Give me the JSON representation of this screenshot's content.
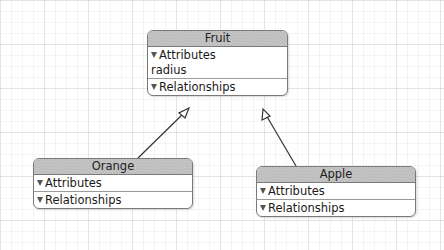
{
  "diagram": {
    "type": "entity-relationship",
    "entities": [
      {
        "name": "Fruit",
        "sections": {
          "attributes_label": "Attributes",
          "attributes": [
            "radius"
          ],
          "relationships_label": "Relationships"
        }
      },
      {
        "name": "Orange",
        "parent": "Fruit",
        "sections": {
          "attributes_label": "Attributes",
          "relationships_label": "Relationships"
        }
      },
      {
        "name": "Apple",
        "parent": "Fruit",
        "sections": {
          "attributes_label": "Attributes",
          "relationships_label": "Relationships"
        }
      }
    ],
    "edges": [
      {
        "from": "Orange",
        "to": "Fruit",
        "kind": "inheritance"
      },
      {
        "from": "Apple",
        "to": "Fruit",
        "kind": "inheritance"
      }
    ],
    "icons": {
      "disclosure": "disclosure-triangle-icon",
      "arrowhead": "hollow-arrowhead-icon"
    },
    "colors": {
      "title_bar": "#b9b9b9",
      "border": "#7a7a7a",
      "grid": "#e0e0e0"
    }
  }
}
